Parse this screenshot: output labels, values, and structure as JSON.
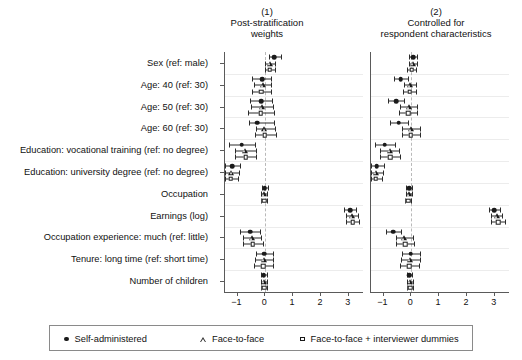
{
  "chart_data": {
    "type": "scatter",
    "title": "",
    "xlabel": "",
    "ylabel": "",
    "xlim": [
      -1.45,
      3.55
    ],
    "xticks": [
      -1,
      0,
      1,
      2,
      3
    ],
    "xticklabels": [
      "−1",
      "0",
      "1",
      "2",
      "3"
    ],
    "grid": true,
    "zero_reference_line": 0,
    "legend_position": "bottom",
    "panels": [
      {
        "number": "(1)",
        "title_lines": [
          "Post-stratification",
          "weights"
        ]
      },
      {
        "number": "(2)",
        "title_lines": [
          "Controlled for",
          "respondent characteristics"
        ]
      }
    ],
    "series": [
      {
        "name": "Self-administered",
        "marker": "circle"
      },
      {
        "name": "Face-to-face",
        "marker": "triangle"
      },
      {
        "name": "Face-to-face + interviewer dummies",
        "marker": "square"
      }
    ],
    "categories": [
      "Sex (ref: male)",
      "Age: 40 (ref: 30)",
      "Age: 50 (ref: 30)",
      "Age: 60 (ref: 30)",
      "Education: vocational training (ref: no degree)",
      "Education: university degree (ref: no degree)",
      "Occupation",
      "Earnings (log)",
      "Occupation experience: much (ref: little)",
      "Tenure: long time (ref: short time)",
      "Number of children"
    ],
    "estimates": {
      "panel_1": {
        "Self-administered": [
          {
            "est": 0.33,
            "lo": 0.12,
            "hi": 0.55
          },
          {
            "est": -0.12,
            "lo": -0.47,
            "hi": 0.22
          },
          {
            "est": -0.15,
            "lo": -0.55,
            "hi": 0.25
          },
          {
            "est": -0.3,
            "lo": -0.6,
            "hi": 0.32
          },
          {
            "est": -0.85,
            "lo": -1.32,
            "hi": -0.38
          },
          {
            "est": -1.2,
            "lo": -1.45,
            "hi": -0.92
          },
          {
            "est": -0.02,
            "lo": -0.13,
            "hi": 0.1
          },
          {
            "est": 3.05,
            "lo": 2.82,
            "hi": 3.28
          },
          {
            "est": -0.55,
            "lo": -0.92,
            "hi": -0.18
          },
          {
            "est": -0.03,
            "lo": -0.35,
            "hi": 0.28
          },
          {
            "est": -0.06,
            "lo": -0.16,
            "hi": 0.05
          }
        ],
        "Face-to-face": [
          {
            "est": 0.18,
            "lo": 0.0,
            "hi": 0.36
          },
          {
            "est": -0.1,
            "lo": -0.42,
            "hi": 0.22
          },
          {
            "est": -0.12,
            "lo": -0.52,
            "hi": 0.28
          },
          {
            "est": -0.03,
            "lo": -0.35,
            "hi": 0.35
          },
          {
            "est": -0.72,
            "lo": -1.1,
            "hi": -0.34
          },
          {
            "est": -1.22,
            "lo": -1.45,
            "hi": -0.95
          },
          {
            "est": -0.04,
            "lo": -0.14,
            "hi": 0.07
          },
          {
            "est": 3.12,
            "lo": 2.9,
            "hi": 3.34
          },
          {
            "est": -0.48,
            "lo": -0.82,
            "hi": -0.14
          },
          {
            "est": -0.05,
            "lo": -0.38,
            "hi": 0.27
          },
          {
            "est": -0.05,
            "lo": -0.15,
            "hi": 0.06
          }
        ],
        "Face-to-face + interviewer dummies": [
          {
            "est": 0.16,
            "lo": -0.02,
            "hi": 0.34
          },
          {
            "est": -0.14,
            "lo": -0.48,
            "hi": 0.2
          },
          {
            "est": -0.16,
            "lo": -0.62,
            "hi": 0.3
          },
          {
            "est": -0.02,
            "lo": -0.38,
            "hi": 0.38
          },
          {
            "est": -0.7,
            "lo": -1.08,
            "hi": -0.32
          },
          {
            "est": -1.24,
            "lo": -1.45,
            "hi": -0.98
          },
          {
            "est": -0.05,
            "lo": -0.16,
            "hi": 0.06
          },
          {
            "est": 3.14,
            "lo": 2.9,
            "hi": 3.38
          },
          {
            "est": -0.45,
            "lo": -0.8,
            "hi": -0.1
          },
          {
            "est": -0.08,
            "lo": -0.42,
            "hi": 0.27
          },
          {
            "est": -0.04,
            "lo": -0.14,
            "hi": 0.07
          }
        ]
      },
      "panel_2": {
        "Self-administered": [
          {
            "est": 0.07,
            "lo": -0.08,
            "hi": 0.22
          },
          {
            "est": -0.38,
            "lo": -0.62,
            "hi": -0.12
          },
          {
            "est": -0.55,
            "lo": -0.85,
            "hi": -0.25
          },
          {
            "est": -0.45,
            "lo": -0.78,
            "hi": -0.12
          },
          {
            "est": -0.95,
            "lo": -1.3,
            "hi": -0.6
          },
          {
            "est": -1.25,
            "lo": -1.45,
            "hi": -1.0
          },
          {
            "est": -0.08,
            "lo": -0.18,
            "hi": 0.03
          },
          {
            "est": 2.98,
            "lo": 2.78,
            "hi": 3.18
          },
          {
            "est": -0.65,
            "lo": -0.92,
            "hi": -0.38
          },
          {
            "est": -0.02,
            "lo": -0.35,
            "hi": 0.3
          },
          {
            "est": -0.07,
            "lo": -0.17,
            "hi": 0.04
          }
        ],
        "Face-to-face": [
          {
            "est": 0.05,
            "lo": -0.1,
            "hi": 0.2
          },
          {
            "est": -0.05,
            "lo": -0.28,
            "hi": 0.18
          },
          {
            "est": -0.1,
            "lo": -0.42,
            "hi": 0.22
          },
          {
            "est": -0.02,
            "lo": -0.32,
            "hi": 0.3
          },
          {
            "est": -0.78,
            "lo": -1.12,
            "hi": -0.44
          },
          {
            "est": -1.26,
            "lo": -1.45,
            "hi": -1.02
          },
          {
            "est": -0.1,
            "lo": -0.2,
            "hi": 0.01
          },
          {
            "est": 3.08,
            "lo": 2.88,
            "hi": 3.28
          },
          {
            "est": -0.25,
            "lo": -0.55,
            "hi": 0.05
          },
          {
            "est": -0.04,
            "lo": -0.38,
            "hi": 0.3
          },
          {
            "est": -0.06,
            "lo": -0.16,
            "hi": 0.05
          }
        ],
        "Face-to-face + interviewer dummies": [
          {
            "est": 0.02,
            "lo": -0.14,
            "hi": 0.18
          },
          {
            "est": -0.06,
            "lo": -0.3,
            "hi": 0.18
          },
          {
            "est": -0.12,
            "lo": -0.46,
            "hi": 0.22
          },
          {
            "est": -0.02,
            "lo": -0.34,
            "hi": 0.32
          },
          {
            "est": -0.76,
            "lo": -1.12,
            "hi": -0.4
          },
          {
            "est": -1.28,
            "lo": -1.45,
            "hi": -1.04
          },
          {
            "est": -0.12,
            "lo": -0.24,
            "hi": 0.0
          },
          {
            "est": 3.12,
            "lo": 2.88,
            "hi": 3.36
          },
          {
            "est": -0.22,
            "lo": -0.55,
            "hi": 0.1
          },
          {
            "est": -0.07,
            "lo": -0.42,
            "hi": 0.28
          },
          {
            "est": -0.05,
            "lo": -0.15,
            "hi": 0.06
          }
        ]
      }
    }
  },
  "legend": {
    "items": [
      {
        "label": "Self-administered",
        "marker": "circle"
      },
      {
        "label": "Face-to-face",
        "marker": "triangle"
      },
      {
        "label": "Face-to-face + interviewer dummies",
        "marker": "square"
      }
    ]
  }
}
